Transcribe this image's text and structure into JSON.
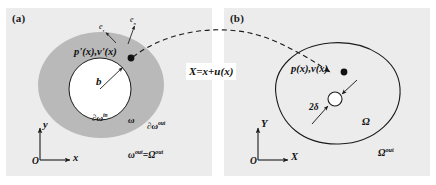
{
  "figure": {
    "width": 436,
    "height": 185,
    "background": "#ffffff",
    "panel_background": "#ececed"
  },
  "colors": {
    "panel_bg": "#ececed",
    "annulus_gray": "#b9b9b9",
    "inner_white": "#ffffff",
    "stroke": "#1a1a1a",
    "text": "#111111",
    "map_box_bg": "#ffffff"
  },
  "panel_a": {
    "label": "(a)",
    "field_label": "p'(x),v'(x)",
    "radius_label": "b",
    "inner_boundary_label": "∂ω",
    "inner_boundary_sup": "in",
    "outer_boundary_label": "∂ω",
    "outer_boundary_sup": "out",
    "domain_label": "ω",
    "exterior_label_left": "ω",
    "exterior_label_left_sup": "out",
    "exterior_equals": "=",
    "exterior_label_right": "Ω",
    "exterior_label_right_sup": "out",
    "normal_vector_label": "e",
    "normal_vector_sub": "n",
    "tangent_vector_label": "e",
    "tangent_vector_sub": "τ",
    "axes": {
      "origin": "O",
      "x_axis": "x",
      "y_axis": "y"
    }
  },
  "panel_b": {
    "label": "(b)",
    "field_label": "p(x),v(x)",
    "hole_size_label": "2δ",
    "domain_label": "Ω",
    "exterior_label": "Ω",
    "exterior_sup": "out",
    "axes": {
      "origin": "O",
      "x_axis": "X",
      "y_axis": "Y"
    }
  },
  "mapping": {
    "equation": "X=x+u(x)"
  }
}
